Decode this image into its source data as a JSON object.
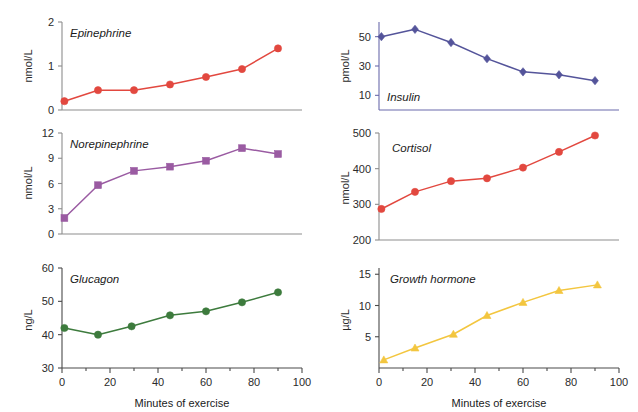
{
  "figure": {
    "width": 638,
    "height": 412,
    "background": "#ffffff",
    "x_axis_caption_left": "Minutes of exercise",
    "x_axis_caption_right": "Minutes of exercise"
  },
  "chart_data": [
    {
      "id": "epinephrine",
      "type": "line",
      "title": "Epinephrine",
      "xlabel": "Minutes of exercise",
      "ylabel": "nmol/L",
      "x": [
        1,
        15,
        30,
        45,
        60,
        75,
        90
      ],
      "values": [
        0.2,
        0.45,
        0.45,
        0.58,
        0.75,
        0.93,
        1.4
      ],
      "xlim": [
        0,
        100
      ],
      "ylim": [
        0,
        2
      ],
      "yticks": [
        0,
        1,
        2
      ],
      "ytick_labels": [
        "0",
        "1",
        "2"
      ],
      "xticks": [
        0,
        20,
        40,
        60,
        80,
        100
      ],
      "xtick_labels": [
        "",
        "",
        "",
        "",
        "",
        ""
      ],
      "color": "#e2483f",
      "marker": "circle",
      "grid": false,
      "legend": "none",
      "axis_color": "#8d8d8d",
      "label_color": "#2b2b2b"
    },
    {
      "id": "insulin",
      "type": "line",
      "title": "Insulin",
      "xlabel": "Minutes of exercise",
      "ylabel": "pmol/L",
      "x": [
        1,
        15,
        30,
        45,
        60,
        75,
        90
      ],
      "values": [
        50,
        55,
        46,
        35,
        26,
        24,
        20
      ],
      "xlim": [
        0,
        100
      ],
      "ylim": [
        0,
        60
      ],
      "yticks": [
        10,
        30,
        50
      ],
      "ytick_labels": [
        "10",
        "30",
        "50"
      ],
      "xticks": [
        0,
        20,
        40,
        60,
        80,
        100
      ],
      "xtick_labels": [
        "",
        "",
        "",
        "",
        "",
        ""
      ],
      "color": "#54549a",
      "marker": "diamond",
      "grid": false,
      "legend": "none",
      "axis_color": "#6b6bab",
      "label_color": "#54549a"
    },
    {
      "id": "norepinephrine",
      "type": "line",
      "title": "Norepinephrine",
      "xlabel": "Minutes of exercise",
      "ylabel": "nmol/L",
      "x": [
        1,
        15,
        30,
        45,
        60,
        75,
        90
      ],
      "values": [
        1.9,
        5.8,
        7.5,
        8.0,
        8.7,
        10.2,
        9.5
      ],
      "xlim": [
        0,
        100
      ],
      "ylim": [
        0,
        12
      ],
      "yticks": [
        0,
        3,
        6,
        9,
        12
      ],
      "ytick_labels": [
        "0",
        "3",
        "6",
        "9",
        "12"
      ],
      "xticks": [
        0,
        20,
        40,
        60,
        80,
        100
      ],
      "xtick_labels": [
        "",
        "",
        "",
        "",
        "",
        ""
      ],
      "color": "#9a5ba2",
      "marker": "square",
      "grid": false,
      "legend": "none",
      "axis_color": "#8d8d8d",
      "label_color": "#2b2b2b"
    },
    {
      "id": "cortisol",
      "type": "line",
      "title": "Cortisol",
      "xlabel": "Minutes of exercise",
      "ylabel": "nmol/L",
      "x": [
        1,
        15,
        30,
        45,
        60,
        75,
        90
      ],
      "values": [
        287,
        335,
        365,
        373,
        403,
        447,
        493
      ],
      "xlim": [
        0,
        100
      ],
      "ylim": [
        200,
        500
      ],
      "yticks": [
        200,
        300,
        400,
        500
      ],
      "ytick_labels": [
        "200",
        "300",
        "400",
        "500"
      ],
      "xticks": [
        0,
        20,
        40,
        60,
        80,
        100
      ],
      "xtick_labels": [
        "",
        "",
        "",
        "",
        "",
        ""
      ],
      "color": "#e2483f",
      "marker": "circle",
      "grid": false,
      "legend": "none",
      "axis_color": "#8d8d8d",
      "label_color": "#2b2b2b"
    },
    {
      "id": "glucagon",
      "type": "line",
      "title": "Glucagon",
      "xlabel": "Minutes of exercise",
      "ylabel": "ng/L",
      "x": [
        1,
        15,
        29,
        45,
        60,
        75,
        90
      ],
      "values": [
        42,
        40,
        42.5,
        45.8,
        47,
        49.7,
        52.7
      ],
      "xlim": [
        0,
        100
      ],
      "ylim": [
        30,
        60
      ],
      "yticks": [
        30,
        40,
        50,
        60
      ],
      "ytick_labels": [
        "30",
        "40",
        "50",
        "60"
      ],
      "xticks": [
        0,
        20,
        40,
        60,
        80,
        100
      ],
      "xtick_labels": [
        "0",
        "20",
        "40",
        "60",
        "80",
        "100"
      ],
      "color": "#3d7b3d",
      "marker": "circle",
      "grid": false,
      "legend": "none",
      "axis_color": "#4a4a4a",
      "label_color": "#2b2b2b"
    },
    {
      "id": "growth-hormone",
      "type": "line",
      "title": "Growth hormone",
      "xlabel": "Minutes of exercise",
      "ylabel": "µg/L",
      "x": [
        2,
        15,
        31,
        45,
        60,
        75,
        91
      ],
      "values": [
        1.3,
        3.2,
        5.4,
        8.4,
        10.5,
        12.4,
        13.3
      ],
      "xlim": [
        0,
        100
      ],
      "ylim": [
        0,
        16
      ],
      "yticks": [
        5,
        10,
        15
      ],
      "ytick_labels": [
        "5",
        "10",
        "15"
      ],
      "xticks": [
        0,
        20,
        40,
        60,
        80,
        100
      ],
      "xtick_labels": [
        "0",
        "20",
        "40",
        "60",
        "80",
        "100"
      ],
      "color": "#f3c63f",
      "marker": "triangle",
      "grid": false,
      "legend": "none",
      "axis_color": "#4a4a4a",
      "label_color": "#2b2b2b"
    }
  ]
}
